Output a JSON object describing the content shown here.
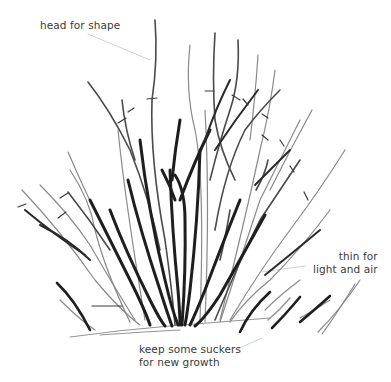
{
  "illustration": {
    "subject": "pruned shrub line drawing",
    "stroke_dark": "#222222",
    "stroke_mid": "#555555",
    "stroke_light": "#8a8a8a",
    "leader_color": "#cfcfcf"
  },
  "annotations": {
    "head": {
      "text": "head for shape"
    },
    "thin": {
      "line1": "thin for",
      "line2": "light and air"
    },
    "keep": {
      "line1": "keep some suckers",
      "line2": "for new growth"
    }
  }
}
